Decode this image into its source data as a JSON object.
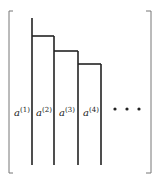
{
  "diagram": {
    "type": "staircase-matrix",
    "colors": {
      "line": "#222222",
      "bracket": "#777777",
      "background": "#ffffff"
    },
    "columns": [
      {
        "label": "a",
        "superscript": "(1)"
      },
      {
        "label": "a",
        "superscript": "(2)"
      },
      {
        "label": "a",
        "superscript": "(3)"
      },
      {
        "label": "a",
        "superscript": "(4)"
      }
    ],
    "ellipsis": "• • •"
  }
}
